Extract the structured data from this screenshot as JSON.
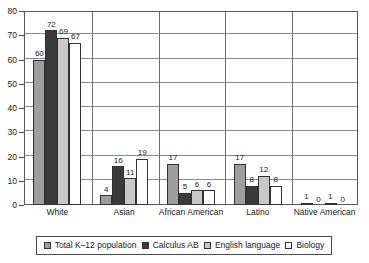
{
  "chart_data": {
    "type": "bar",
    "title": "",
    "subtitle": "",
    "xlabel": "",
    "ylabel": "",
    "ylim": [
      0,
      80
    ],
    "ytick_step": 10,
    "yticks": [
      "0",
      "10",
      "20",
      "30",
      "40",
      "50",
      "60",
      "70",
      "80"
    ],
    "grid": true,
    "legend_position": "bottom",
    "categories": [
      "White",
      "Asian",
      "African American",
      "Latino",
      "Native American"
    ],
    "series": [
      {
        "name": "Total K–12 population",
        "color": "#9e9e9e",
        "values": [
          60,
          4,
          17,
          17,
          1
        ]
      },
      {
        "name": "Calculus AB",
        "color": "#3a3a3a",
        "values": [
          72,
          16,
          5,
          8,
          0
        ]
      },
      {
        "name": "English language",
        "color": "#c8c8c8",
        "values": [
          69,
          11,
          6,
          12,
          1
        ]
      },
      {
        "name": "Biology",
        "color": "#ffffff",
        "values": [
          67,
          19,
          6,
          8,
          0
        ]
      }
    ]
  },
  "style": {
    "plot_border_color": "#5a5a5a",
    "gridline_color": "#8a8a8a",
    "separator_color": "#6e6e6e",
    "bar_outline_color": "#333333",
    "text_color": "#1a1a1a",
    "background": "#ffffff"
  }
}
